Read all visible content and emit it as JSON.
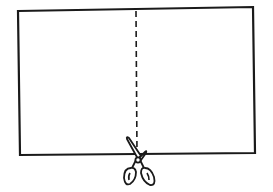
{
  "illustration": {
    "description": "Sheet of paper with dashed cut line and scissors",
    "paper": {
      "stroke": "#1a1a1a",
      "fill": "#ffffff"
    },
    "cut_line": {
      "style": "dashed",
      "stroke": "#1a1a1a"
    },
    "scissors": {
      "icon": "scissors-icon",
      "stroke": "#1a1a1a"
    }
  }
}
